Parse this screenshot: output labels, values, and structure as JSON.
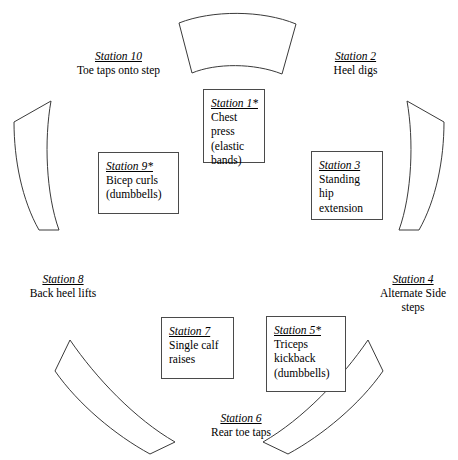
{
  "diagram": {
    "type": "circuit-training-station-layout",
    "boxed_stations": [
      {
        "id": "station1",
        "title": "Station 1*",
        "desc": "Chest\npress\n(elastic\nbands)"
      },
      {
        "id": "station9",
        "title": "Station 9*",
        "desc": "Bicep curls\n(dumbbells)"
      },
      {
        "id": "station3",
        "title": "Station 3",
        "desc": "Standing\nhip\nextension"
      },
      {
        "id": "station7",
        "title": "Station 7",
        "desc": "Single calf\nraises"
      },
      {
        "id": "station5",
        "title": "Station 5*",
        "desc": "Triceps\nkickback\n(dumbbells)"
      }
    ],
    "outer_stations": [
      {
        "id": "station10",
        "title": "Station 10",
        "desc": "Toe taps onto step"
      },
      {
        "id": "station2",
        "title": "Station 2",
        "desc": "Heel digs"
      },
      {
        "id": "station8",
        "title": "Station 8",
        "desc": "Back heel lifts"
      },
      {
        "id": "station4",
        "title": "Station 4",
        "desc": "Alternate Side\nsteps"
      },
      {
        "id": "station6",
        "title": "Station 6",
        "desc": "Rear toe taps"
      }
    ],
    "arc_color": "#3a3a3a",
    "box_border_color": "#4a4a4a",
    "background": "#ffffff"
  }
}
